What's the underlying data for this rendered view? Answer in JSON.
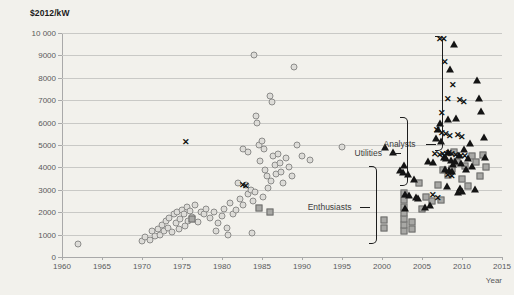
{
  "chart_data": {
    "type": "scatter",
    "title": "",
    "ylabel": "$2012/kW",
    "xlabel": "Year",
    "xlim": [
      1960,
      2015
    ],
    "ylim": [
      0,
      10000
    ],
    "xticks": [
      1960,
      1965,
      1970,
      1975,
      1980,
      1985,
      1990,
      1995,
      2000,
      2005,
      2010,
      2015
    ],
    "yticks": [
      0,
      1000,
      2000,
      3000,
      4000,
      5000,
      6000,
      7000,
      8000,
      9000,
      10000
    ],
    "ytick_labels": [
      "0",
      "1000",
      "2000",
      "3000",
      "4000",
      "5000",
      "6000",
      "7000",
      "8000",
      "9000",
      "10 000"
    ],
    "grid": true,
    "legend_position": "none",
    "colors": {
      "background": "#f2f1ec",
      "gridline": "#c9c9c6",
      "axis": "#a9a9a9",
      "circle_fill": "#dddcd8",
      "circle_stroke": "#8c8c8a",
      "square_fill": "#a8a8a5",
      "square_stroke": "#6d6d6b",
      "triangle": "#141414",
      "cross": "#111111",
      "text": "#59595b",
      "annotation": "#3c3c3c"
    },
    "series": [
      {
        "name": "circle",
        "marker": "circle",
        "points": [
          [
            1962,
            580
          ],
          [
            1970,
            700
          ],
          [
            1970.4,
            900
          ],
          [
            1971,
            760
          ],
          [
            1971.3,
            1150
          ],
          [
            1971.6,
            950
          ],
          [
            1972,
            1250
          ],
          [
            1972.2,
            1000
          ],
          [
            1972.5,
            1450
          ],
          [
            1972.8,
            1150
          ],
          [
            1973,
            1600
          ],
          [
            1973.2,
            1300
          ],
          [
            1973.4,
            1750
          ],
          [
            1973.7,
            1100
          ],
          [
            1974,
            1900
          ],
          [
            1974.2,
            1500
          ],
          [
            1974.4,
            2000
          ],
          [
            1974.6,
            1250
          ],
          [
            1974.8,
            1700
          ],
          [
            1975,
            2100
          ],
          [
            1975.2,
            1900
          ],
          [
            1975.4,
            1400
          ],
          [
            1975.6,
            2250
          ],
          [
            1975.8,
            1600
          ],
          [
            1976,
            2050
          ],
          [
            1976.3,
            1800
          ],
          [
            1976.6,
            2300
          ],
          [
            1977,
            1550
          ],
          [
            1977.4,
            2000
          ],
          [
            1977.8,
            1900
          ],
          [
            1978,
            2150
          ],
          [
            1978.5,
            1750
          ],
          [
            1979,
            2000
          ],
          [
            1979.5,
            1500
          ],
          [
            1980,
            1850
          ],
          [
            1980.3,
            2150
          ],
          [
            1980.6,
            1300
          ],
          [
            1981,
            2400
          ],
          [
            1981.4,
            1900
          ],
          [
            1981.8,
            2100
          ],
          [
            1982,
            3300
          ],
          [
            1982.3,
            2600
          ],
          [
            1982.6,
            2300
          ],
          [
            1983,
            3200
          ],
          [
            1983.3,
            2800
          ],
          [
            1983.6,
            3000
          ],
          [
            1983.9,
            2500
          ],
          [
            1984,
            9000
          ],
          [
            1984.2,
            6300
          ],
          [
            1984.4,
            6000
          ],
          [
            1984.6,
            5000
          ],
          [
            1984.8,
            4300
          ],
          [
            1985,
            5200
          ],
          [
            1985.2,
            4800
          ],
          [
            1985.4,
            3900
          ],
          [
            1985.6,
            3600
          ],
          [
            1985.8,
            3100
          ],
          [
            1986,
            7200
          ],
          [
            1986.2,
            6900
          ],
          [
            1986.4,
            4500
          ],
          [
            1986.6,
            4100
          ],
          [
            1986.8,
            3700
          ],
          [
            1987,
            4600
          ],
          [
            1987.2,
            4200
          ],
          [
            1987.4,
            3800
          ],
          [
            1987.6,
            3300
          ],
          [
            1988,
            4400
          ],
          [
            1988.4,
            4000
          ],
          [
            1988.8,
            3600
          ],
          [
            1989,
            8500
          ],
          [
            1989.4,
            5000
          ],
          [
            1990,
            4500
          ],
          [
            1991,
            4350
          ],
          [
            1995,
            4900
          ],
          [
            1982.6,
            4800
          ],
          [
            1983.2,
            4700
          ],
          [
            1986.1,
            3400
          ],
          [
            1984.1,
            2900
          ],
          [
            1985.1,
            2700
          ],
          [
            1983.8,
            1050
          ],
          [
            1980.8,
            1000
          ],
          [
            1979.2,
            1150
          ]
        ]
      },
      {
        "name": "square",
        "marker": "square",
        "points": [
          [
            1976.2,
            1700
          ],
          [
            1984.6,
            2200
          ],
          [
            1986.0,
            2000
          ],
          [
            2002.8,
            1150
          ],
          [
            2002.8,
            1450
          ],
          [
            2002.8,
            1700
          ],
          [
            2002.8,
            1950
          ],
          [
            2002.8,
            2250
          ],
          [
            2002.8,
            2550
          ],
          [
            2002.8,
            2850
          ],
          [
            2000.3,
            1300
          ],
          [
            2000.3,
            1650
          ],
          [
            2003.8,
            1250
          ],
          [
            2003.8,
            1550
          ],
          [
            2004.6,
            3300
          ],
          [
            2005.5,
            2700
          ],
          [
            2006.3,
            2500
          ],
          [
            2007.0,
            3200
          ],
          [
            2007.6,
            3900
          ],
          [
            2008.2,
            3650
          ],
          [
            2008.8,
            3950
          ],
          [
            2009.4,
            4250
          ],
          [
            2010.0,
            3500
          ],
          [
            2010.4,
            4050
          ],
          [
            2010.8,
            3150
          ],
          [
            2011.2,
            4500
          ],
          [
            2011.8,
            4250
          ],
          [
            2012.2,
            3600
          ],
          [
            2012.6,
            4550
          ],
          [
            2013.0,
            4000
          ],
          [
            2009.0,
            4700
          ],
          [
            2007.4,
            2550
          ],
          [
            2005.0,
            2150
          ]
        ]
      },
      {
        "name": "triangle",
        "marker": "triangle",
        "points": [
          [
            2000.4,
            4900
          ],
          [
            2001.4,
            4700
          ],
          [
            2002.3,
            3900
          ],
          [
            2002.6,
            3800
          ],
          [
            2002.8,
            4100
          ],
          [
            2003.2,
            3700
          ],
          [
            2002.9,
            2800
          ],
          [
            2003.4,
            2750
          ],
          [
            2002.9,
            2200
          ],
          [
            2004.0,
            3500
          ],
          [
            2004.2,
            2700
          ],
          [
            2004.5,
            2650
          ],
          [
            2005.8,
            4300
          ],
          [
            2006.4,
            4250
          ],
          [
            2006.8,
            5300
          ],
          [
            2007.0,
            5700
          ],
          [
            2007.4,
            5200
          ],
          [
            2007.7,
            4450
          ],
          [
            2008.0,
            4400
          ],
          [
            2008.3,
            4700
          ],
          [
            2008.6,
            4350
          ],
          [
            2008.9,
            4150
          ],
          [
            2009.1,
            4300
          ],
          [
            2007.9,
            3950
          ],
          [
            2008.4,
            3900
          ],
          [
            2008.8,
            3850
          ],
          [
            2008.2,
            6150
          ],
          [
            2008.5,
            8400
          ],
          [
            2009.0,
            9500
          ],
          [
            2009.3,
            6200
          ],
          [
            2009.6,
            4550
          ],
          [
            2009.9,
            4200
          ],
          [
            2010.2,
            4800
          ],
          [
            2010.5,
            3950
          ],
          [
            2010.8,
            4400
          ],
          [
            2011.0,
            5100
          ],
          [
            2011.3,
            4050
          ],
          [
            2011.6,
            3050
          ],
          [
            2011.9,
            7900
          ],
          [
            2012.1,
            7100
          ],
          [
            2012.4,
            6500
          ],
          [
            2012.7,
            5350
          ],
          [
            2012.9,
            4450
          ],
          [
            2010.0,
            2950
          ],
          [
            2009.5,
            2900
          ],
          [
            2006.0,
            2300
          ],
          [
            2005.4,
            2250
          ],
          [
            2007.2,
            6000
          ],
          [
            2008.1,
            3150
          ],
          [
            2009.8,
            3100
          ]
        ]
      },
      {
        "name": "cross",
        "marker": "cross",
        "points": [
          [
            1975.5,
            5150
          ],
          [
            1982.6,
            3200
          ],
          [
            1983.0,
            3150
          ],
          [
            2007.2,
            9750
          ],
          [
            2007.8,
            9750
          ],
          [
            2007.9,
            8700
          ],
          [
            2008.9,
            7700
          ],
          [
            2008.2,
            7050
          ],
          [
            2009.8,
            7000
          ],
          [
            2010.2,
            6900
          ],
          [
            2007.5,
            6450
          ],
          [
            2006.9,
            5650
          ],
          [
            2007.5,
            5550
          ],
          [
            2008.0,
            5500
          ],
          [
            2008.5,
            5400
          ],
          [
            2007.6,
            4600
          ],
          [
            2008.1,
            4600
          ],
          [
            2008.4,
            4650
          ],
          [
            2008.7,
            4600
          ],
          [
            2009.3,
            4550
          ],
          [
            2009.9,
            4500
          ],
          [
            2010.4,
            4500
          ],
          [
            2007.3,
            4550
          ],
          [
            2008.3,
            3650
          ],
          [
            2008.7,
            3600
          ],
          [
            2006.4,
            2750
          ],
          [
            2007.0,
            2650
          ],
          [
            2009.5,
            5450
          ],
          [
            2010.0,
            5350
          ],
          [
            2006.6,
            4600
          ]
        ]
      }
    ],
    "annotations": [
      {
        "id": "analysts",
        "label": "Analysts",
        "y_center": 5050,
        "y_top": 9850,
        "y_bottom": 4800,
        "x_bracket": 2006.6,
        "x_label_right": 2004.2
      },
      {
        "id": "utilities",
        "label": "Utilities",
        "y_center": 4650,
        "y_top": 6250,
        "y_bottom": 3250,
        "x_bracket": 2002.3,
        "x_label_right": 2000.0
      },
      {
        "id": "enthusiasts",
        "label": "Enthusiasts",
        "y_center": 2250,
        "y_top": 4050,
        "y_bottom": 650,
        "x_bracket": 1998.4,
        "x_label_right": 1996.2
      }
    ]
  }
}
